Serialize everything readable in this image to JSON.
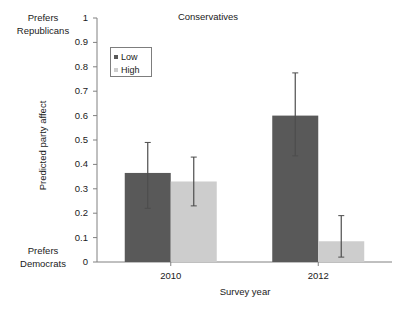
{
  "chart_data": {
    "type": "bar",
    "title": "Conservatives",
    "xlabel": "Survey year",
    "ylabel": "Predicted party affect",
    "categories": [
      "2010",
      "2012"
    ],
    "ylim": [
      0,
      1
    ],
    "yticks": [
      "0",
      "0.1",
      "0.2",
      "0.3",
      "0.4",
      "0.5",
      "0.6",
      "0.7",
      "0.8",
      "0.9",
      "1"
    ],
    "ytick_values": [
      0,
      0.1,
      0.2,
      0.3,
      0.4,
      0.5,
      0.6,
      0.7,
      0.8,
      0.9,
      1
    ],
    "grid": false,
    "legend_position": "upper-left-inside",
    "series": [
      {
        "name": "Low",
        "color": "#595959",
        "values": [
          0.365,
          0.6
        ],
        "err_low": [
          0.22,
          0.435
        ],
        "err_high": [
          0.49,
          0.775
        ]
      },
      {
        "name": "High",
        "color": "#cdcdcd",
        "values": [
          0.33,
          0.085
        ],
        "err_low": [
          0.23,
          0.02
        ],
        "err_high": [
          0.43,
          0.19
        ]
      }
    ],
    "annotations": [
      {
        "name": "axis-top-annotation",
        "line1": "Prefers",
        "line2": "Republicans"
      },
      {
        "name": "axis-bottom-annotation",
        "line1": "Prefers",
        "line2": "Democrats"
      }
    ],
    "axis_color": "#808080"
  }
}
